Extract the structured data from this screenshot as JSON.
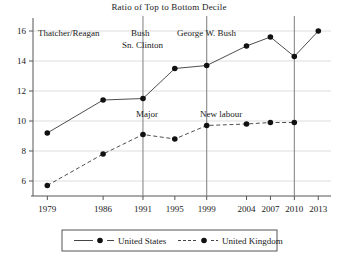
{
  "chart_data": {
    "type": "line",
    "title": "Ratio of Top to Bottom Decile",
    "xlabel": "",
    "ylabel": "",
    "x": [
      1979,
      1986,
      1991,
      1995,
      1999,
      2004,
      2007,
      2010,
      2013
    ],
    "xtick_labels": [
      "1979",
      "1986",
      "1991",
      "1995",
      "1999",
      "2004",
      "2007",
      "2010",
      "2013"
    ],
    "ytick_labels": [
      "6",
      "8",
      "10",
      "12",
      "14",
      "16"
    ],
    "yticks": [
      6,
      8,
      10,
      12,
      14,
      16
    ],
    "ylim": [
      5.0,
      16.6
    ],
    "xlim": [
      1977.2,
      2014.6
    ],
    "grid": true,
    "legend_position": "bottom",
    "series": [
      {
        "name": "United States",
        "style": "solid",
        "color": "#3a3a3a",
        "values": [
          9.2,
          11.4,
          11.5,
          13.5,
          13.7,
          15.0,
          15.6,
          14.3,
          16.0
        ]
      },
      {
        "name": "United Kingdom",
        "style": "dashed",
        "color": "#3a3a3a",
        "values": [
          5.7,
          7.8,
          9.1,
          8.8,
          9.7,
          9.8,
          9.9,
          9.9,
          null
        ]
      }
    ],
    "annotations": [
      {
        "text": "Thatcher/Reagan",
        "x_px": 38,
        "y_px": 36
      },
      {
        "text": "Bush",
        "x_px": 131,
        "y_px": 36
      },
      {
        "text": "Sn. Clinton",
        "x_px": 122,
        "y_px": 48
      },
      {
        "text": "George W. Bush",
        "x_px": 177,
        "y_px": 36
      },
      {
        "text": "Major",
        "x_px": 136,
        "y_px": 117
      },
      {
        "text": "New labour",
        "x_px": 200,
        "y_px": 117
      }
    ],
    "separators": [
      1991,
      1999,
      2010
    ]
  },
  "legend": {
    "items": [
      {
        "label": "United States",
        "style": "solid"
      },
      {
        "label": "United Kingdom",
        "style": "dashed"
      }
    ]
  }
}
